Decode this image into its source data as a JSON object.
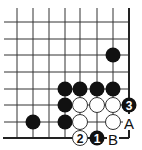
{
  "diagram": {
    "type": "go-board-corner",
    "corner": "bottom-right",
    "grid": {
      "columns_x": [
        17,
        33,
        49,
        65,
        80,
        97,
        113,
        129
      ],
      "rows_y": [
        22,
        39,
        55,
        72,
        89,
        105,
        122,
        138
      ]
    },
    "colors": {
      "black_stone": "#111111",
      "white_stone": "#ffffff",
      "line": "#333333"
    },
    "stones": [
      {
        "color": "black",
        "col": 6,
        "row": 2,
        "label": ""
      },
      {
        "color": "black",
        "col": 3,
        "row": 4,
        "label": ""
      },
      {
        "color": "black",
        "col": 4,
        "row": 4,
        "label": ""
      },
      {
        "color": "black",
        "col": 5,
        "row": 4,
        "label": ""
      },
      {
        "color": "black",
        "col": 6,
        "row": 4,
        "label": ""
      },
      {
        "color": "black",
        "col": 3,
        "row": 5,
        "label": ""
      },
      {
        "color": "white",
        "col": 4,
        "row": 5,
        "label": ""
      },
      {
        "color": "white",
        "col": 5,
        "row": 5,
        "label": ""
      },
      {
        "color": "white",
        "col": 6,
        "row": 5,
        "label": ""
      },
      {
        "color": "black",
        "col": 7,
        "row": 5,
        "label": "3"
      },
      {
        "color": "black",
        "col": 1,
        "row": 6,
        "label": ""
      },
      {
        "color": "black",
        "col": 3,
        "row": 6,
        "label": ""
      },
      {
        "color": "white",
        "col": 4,
        "row": 6,
        "label": ""
      },
      {
        "color": "white",
        "col": 6,
        "row": 6,
        "label": ""
      },
      {
        "color": "white",
        "col": 4,
        "row": 7,
        "label": "2"
      },
      {
        "color": "black",
        "col": 5,
        "row": 7,
        "label": "1"
      }
    ],
    "labels": [
      {
        "text": "A",
        "col": 7,
        "row": 6
      },
      {
        "text": "B",
        "col": 6,
        "row": 7
      }
    ]
  }
}
